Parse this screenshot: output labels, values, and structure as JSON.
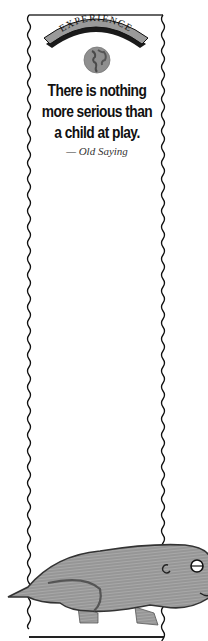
{
  "bookmark": {
    "banner_label": "EXPERIENCE",
    "emblem": "globe-icon",
    "quote_lines": [
      "There is nothing",
      "more serious than",
      "a child at play."
    ],
    "attribution": "— Old Saying",
    "illustration": "hand-drawn pencil sketch of a guinea pig / rodent",
    "colors": {
      "border": "#222222",
      "banner_fill": "#9a9a9a",
      "banner_shadow": "#1a1a1a",
      "text": "#111111",
      "sketch_gray": "#8c8c8c"
    }
  }
}
